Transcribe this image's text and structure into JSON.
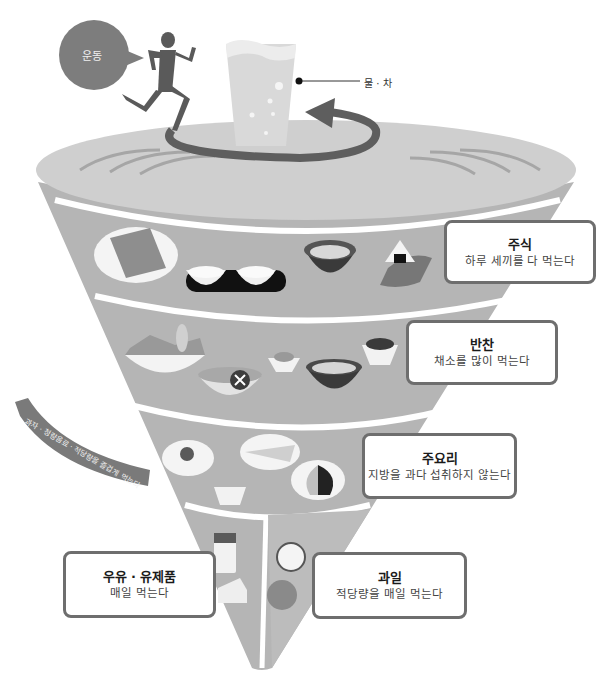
{
  "diagram": {
    "type": "food-balance-spinning-top",
    "colors": {
      "top_disk": "#cfcfcf",
      "band": "#b5b5b5",
      "band_divider": "#ffffff",
      "dark_accent": "#5e5e5e",
      "glass": "#d9d9d9",
      "box_border": "#6e6e6e"
    }
  },
  "exercise": {
    "bubble_label": "운동",
    "icon": "runner-icon"
  },
  "water": {
    "callout_label": "물 · 차",
    "icon": "water-glass-icon"
  },
  "rotation_arrow": {
    "icon": "circular-arrow-icon"
  },
  "tiers": [
    {
      "id": "staple",
      "title": "주식",
      "description": "하루 세끼를 다 먹는다",
      "foods": [
        "bread-slice-icon",
        "rice-bowls-icon",
        "noodle-soup-icon",
        "rice-ball-icon"
      ]
    },
    {
      "id": "side",
      "title": "반찬",
      "description": "채소를 많이 먹는다",
      "foods": [
        "vegetable-salad-icon",
        "mixed-veg-bowl-icon",
        "small-side-dish-icon",
        "soup-bowl-icon",
        "seaweed-dish-icon"
      ]
    },
    {
      "id": "main",
      "title": "주요리",
      "description": "지방을 과다 섭취하지 않는다",
      "foods": [
        "fried-egg-icon",
        "fish-plate-icon",
        "tofu-icon",
        "meat-plate-icon"
      ]
    },
    {
      "id": "dairy",
      "title": "우유 · 유제품",
      "description": "매일 먹는다",
      "foods": [
        "milk-glass-icon",
        "cheese-icon"
      ]
    },
    {
      "id": "fruit",
      "title": "과일",
      "description": "적당량을 매일 먹는다",
      "foods": [
        "apple-icon",
        "orange-icon"
      ]
    }
  ],
  "ribbon": {
    "text": "과자 · 청량음료 · 적당량을 즐겁게 먹는다"
  }
}
